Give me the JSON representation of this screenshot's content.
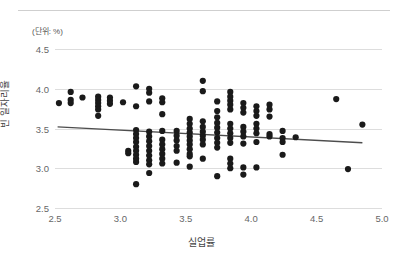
{
  "unit_note": "(단위: %)",
  "chart_data": {
    "type": "scatter",
    "title": "",
    "xlabel": "실업률",
    "ylabel": "빈 일자리율",
    "xlim": [
      2.5,
      5.0
    ],
    "ylim": [
      2.5,
      4.5
    ],
    "xticks": [
      "2.5",
      "3.0",
      "3.5",
      "4.0",
      "4.5",
      "5.0"
    ],
    "yticks": [
      "2.5",
      "3.0",
      "3.5",
      "4.0",
      "4.5"
    ],
    "grid": true,
    "legend": null,
    "marker_color": "#1a1a1a",
    "trendline": {
      "type": "linear",
      "color": "#4d4d4d",
      "x": [
        2.52,
        4.85
      ],
      "y": [
        3.52,
        3.32
      ]
    },
    "points": [
      [
        2.53,
        3.82
      ],
      [
        2.62,
        3.96
      ],
      [
        2.62,
        3.86
      ],
      [
        2.62,
        3.82
      ],
      [
        2.71,
        3.89
      ],
      [
        2.83,
        3.9
      ],
      [
        2.83,
        3.86
      ],
      [
        2.83,
        3.82
      ],
      [
        2.83,
        3.78
      ],
      [
        2.83,
        3.74
      ],
      [
        2.83,
        3.66
      ],
      [
        2.92,
        3.89
      ],
      [
        2.92,
        3.85
      ],
      [
        2.92,
        3.81
      ],
      [
        3.02,
        3.83
      ],
      [
        3.06,
        3.22
      ],
      [
        3.06,
        3.19
      ],
      [
        3.12,
        4.03
      ],
      [
        3.12,
        3.78
      ],
      [
        3.12,
        3.48
      ],
      [
        3.12,
        3.43
      ],
      [
        3.12,
        3.38
      ],
      [
        3.12,
        3.33
      ],
      [
        3.12,
        3.27
      ],
      [
        3.12,
        3.22
      ],
      [
        3.12,
        3.17
      ],
      [
        3.12,
        3.12
      ],
      [
        3.12,
        3.08
      ],
      [
        3.12,
        2.8
      ],
      [
        3.22,
        4.0
      ],
      [
        3.22,
        3.95
      ],
      [
        3.22,
        3.84
      ],
      [
        3.22,
        3.46
      ],
      [
        3.22,
        3.4
      ],
      [
        3.22,
        3.34
      ],
      [
        3.22,
        3.28
      ],
      [
        3.22,
        3.22
      ],
      [
        3.22,
        3.16
      ],
      [
        3.22,
        3.1
      ],
      [
        3.22,
        3.05
      ],
      [
        3.22,
        2.94
      ],
      [
        3.32,
        3.88
      ],
      [
        3.32,
        3.83
      ],
      [
        3.32,
        3.68
      ],
      [
        3.32,
        3.47
      ],
      [
        3.32,
        3.36
      ],
      [
        3.32,
        3.3
      ],
      [
        3.32,
        3.24
      ],
      [
        3.32,
        3.18
      ],
      [
        3.32,
        3.12
      ],
      [
        3.32,
        3.06
      ],
      [
        3.43,
        3.47
      ],
      [
        3.43,
        3.41
      ],
      [
        3.43,
        3.35
      ],
      [
        3.43,
        3.28
      ],
      [
        3.43,
        3.22
      ],
      [
        3.43,
        3.07
      ],
      [
        3.53,
        3.62
      ],
      [
        3.53,
        3.56
      ],
      [
        3.53,
        3.5
      ],
      [
        3.53,
        3.45
      ],
      [
        3.53,
        3.4
      ],
      [
        3.53,
        3.35
      ],
      [
        3.53,
        3.3
      ],
      [
        3.53,
        3.24
      ],
      [
        3.53,
        3.18
      ],
      [
        3.53,
        3.15
      ],
      [
        3.53,
        3.02
      ],
      [
        3.63,
        4.1
      ],
      [
        3.63,
        3.97
      ],
      [
        3.63,
        3.59
      ],
      [
        3.63,
        3.52
      ],
      [
        3.63,
        3.46
      ],
      [
        3.63,
        3.41
      ],
      [
        3.63,
        3.36
      ],
      [
        3.63,
        3.3
      ],
      [
        3.63,
        3.12
      ],
      [
        3.74,
        3.84
      ],
      [
        3.74,
        3.72
      ],
      [
        3.74,
        3.64
      ],
      [
        3.74,
        3.57
      ],
      [
        3.74,
        3.51
      ],
      [
        3.74,
        3.45
      ],
      [
        3.74,
        3.38
      ],
      [
        3.74,
        3.32
      ],
      [
        3.74,
        3.26
      ],
      [
        3.74,
        2.9
      ],
      [
        3.84,
        3.96
      ],
      [
        3.84,
        3.9
      ],
      [
        3.84,
        3.85
      ],
      [
        3.84,
        3.8
      ],
      [
        3.84,
        3.74
      ],
      [
        3.84,
        3.56
      ],
      [
        3.84,
        3.5
      ],
      [
        3.84,
        3.44
      ],
      [
        3.84,
        3.38
      ],
      [
        3.84,
        3.32
      ],
      [
        3.84,
        3.12
      ],
      [
        3.84,
        3.06
      ],
      [
        3.84,
        3.0
      ],
      [
        3.94,
        3.82
      ],
      [
        3.94,
        3.76
      ],
      [
        3.94,
        3.7
      ],
      [
        3.94,
        3.52
      ],
      [
        3.94,
        3.46
      ],
      [
        3.94,
        3.4
      ],
      [
        3.94,
        3.31
      ],
      [
        3.94,
        3.01
      ],
      [
        3.94,
        2.92
      ],
      [
        4.04,
        3.78
      ],
      [
        4.04,
        3.72
      ],
      [
        4.04,
        3.66
      ],
      [
        4.04,
        3.56
      ],
      [
        4.04,
        3.5
      ],
      [
        4.04,
        3.44
      ],
      [
        4.04,
        3.33
      ],
      [
        4.04,
        3.01
      ],
      [
        4.14,
        3.8
      ],
      [
        4.14,
        3.74
      ],
      [
        4.14,
        3.65
      ],
      [
        4.14,
        3.43
      ],
      [
        4.14,
        3.4
      ],
      [
        4.24,
        3.47
      ],
      [
        4.24,
        3.38
      ],
      [
        4.24,
        3.33
      ],
      [
        4.24,
        3.17
      ],
      [
        4.34,
        3.39
      ],
      [
        4.65,
        3.87
      ],
      [
        4.74,
        2.99
      ],
      [
        4.85,
        3.55
      ]
    ]
  }
}
